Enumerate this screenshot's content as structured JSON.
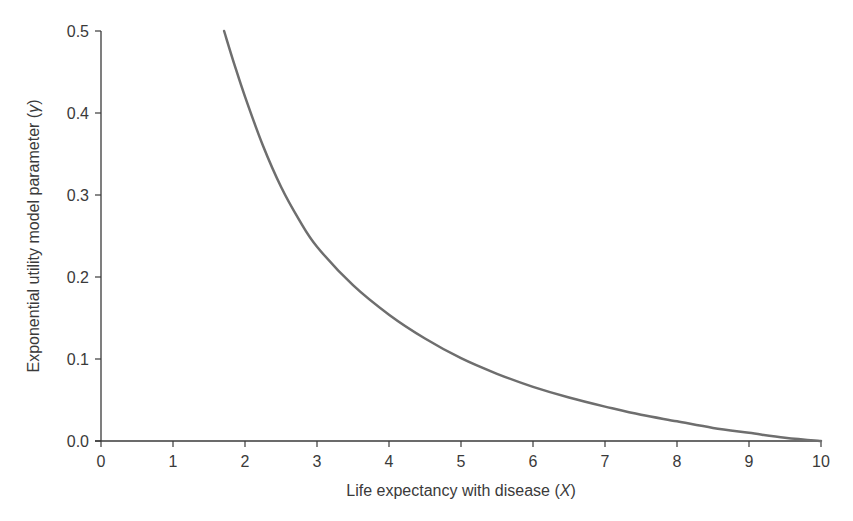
{
  "chart_data": {
    "type": "line",
    "title": "",
    "xlabel": "Life expectancy with disease (X)",
    "xlabel_main": "Life expectancy with disease (",
    "xlabel_var": "X",
    "xlabel_close": ")",
    "ylabel": "Exponential utility model parameter (γ)",
    "ylabel_main": "Exponential utility model parameter (",
    "ylabel_var": "γ",
    "ylabel_close": ")",
    "xlim": [
      0,
      10
    ],
    "ylim": [
      0,
      0.5
    ],
    "x_ticks": [
      "0",
      "1",
      "2",
      "3",
      "4",
      "5",
      "6",
      "7",
      "8",
      "9",
      "10"
    ],
    "y_ticks": [
      "0.0",
      "0.1",
      "0.2",
      "0.3",
      "0.4",
      "0.5"
    ],
    "grid": false,
    "legend": null,
    "line_color": "#6e6e6e",
    "axis_color": "#3a3a3a",
    "series": [
      {
        "name": "gamma",
        "x": [
          1.71,
          1.85,
          2.0,
          2.25,
          2.5,
          2.75,
          3.0,
          3.5,
          4.0,
          4.5,
          5.0,
          5.5,
          6.0,
          6.5,
          7.0,
          7.5,
          8.0,
          8.5,
          9.0,
          9.5,
          10.0
        ],
        "y": [
          0.5,
          0.46,
          0.42,
          0.36,
          0.31,
          0.27,
          0.237,
          0.19,
          0.154,
          0.125,
          0.101,
          0.082,
          0.066,
          0.053,
          0.042,
          0.032,
          0.024,
          0.016,
          0.01,
          0.004,
          0.0
        ]
      }
    ]
  }
}
